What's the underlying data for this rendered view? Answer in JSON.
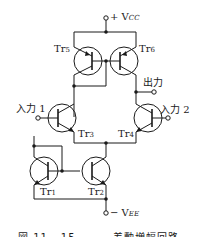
{
  "diagram": {
    "type": "circuit",
    "title": "差動増幅回路",
    "terminals": {
      "vcc": "+ V",
      "vcc_sub": "CC",
      "vee": "− V",
      "vee_sub": "EE",
      "output": "出力",
      "input1": "入力 1",
      "input2": "入力 2"
    },
    "transistors": [
      {
        "id": "tr1",
        "label": "Tr",
        "sub": "1"
      },
      {
        "id": "tr2",
        "label": "Tr",
        "sub": "2"
      },
      {
        "id": "tr3",
        "label": "Tr",
        "sub": "3"
      },
      {
        "id": "tr4",
        "label": "Tr",
        "sub": "4"
      },
      {
        "id": "tr5",
        "label": "Tr",
        "sub": "5"
      },
      {
        "id": "tr6",
        "label": "Tr",
        "sub": "6"
      }
    ],
    "caption": "図 11 - 15　　　 差動増幅回路"
  }
}
